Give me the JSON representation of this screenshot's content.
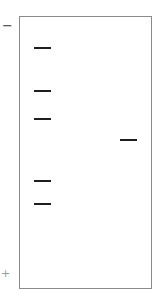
{
  "diagram": {
    "type": "gel-electrophoresis",
    "electrodes": {
      "negative": "−",
      "positive": "+"
    },
    "gel": {
      "border_color": "#8a8a8a",
      "background": "#ffffff"
    },
    "band_color": "#1e1e1e",
    "lanes": [
      {
        "name": "lane-1",
        "bands_y": [
          47,
          90,
          118,
          180,
          203
        ]
      },
      {
        "name": "lane-2",
        "bands_y": [
          139
        ]
      }
    ]
  }
}
